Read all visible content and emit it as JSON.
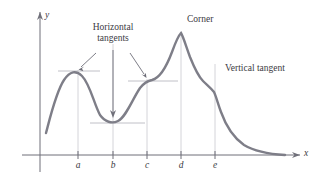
{
  "figure": {
    "background": "#ffffff",
    "curve_color": "#7e7e88",
    "axis_color": "#6e6e78",
    "guide_color": "#c9c9cf",
    "tangent_color": "#b9b9c1",
    "label_color": "#3b3b43",
    "annotations": {
      "horizontal_tangents": "Horizontal\ntangents",
      "horizontal_tangents_line1": "Horizontal",
      "horizontal_tangents_line2": "tangents",
      "corner": "Corner",
      "vertical_tangent": "Vertical tangent"
    },
    "axes": {
      "x_label": "x",
      "y_label": "y",
      "x_axis_y": 155,
      "y_axis_x": 40
    },
    "ticks": [
      {
        "label": "a",
        "x": 78,
        "curve_y": 72
      },
      {
        "label": "b",
        "x": 113,
        "curve_y": 122
      },
      {
        "label": "c",
        "x": 147,
        "curve_y": 81
      },
      {
        "label": "d",
        "x": 181,
        "curve_y": 33
      },
      {
        "label": "e",
        "x": 215,
        "curve_y": 95
      }
    ],
    "tangent_segments": [
      {
        "at": "a",
        "x1": 58,
        "x2": 100,
        "y": 71
      },
      {
        "at": "b",
        "x1": 90,
        "x2": 145,
        "y": 123
      },
      {
        "at": "c",
        "x1": 128,
        "x2": 178,
        "y": 81
      }
    ],
    "curve_path": "M46,133 C50,118 56,92 64,80 C70,71 76,70 82,76 C90,84 94,104 100,115 C105,122 112,124 118,121 C126,117 132,100 140,88 C144,83 147,81 152,80 C160,78 166,68 172,52 C176,41 179,35 181,33 C183,36 186,46 190,57 C194,67 198,76 203,81 C208,86 211,88 214,92 C216,96 218,104 221,112 C226,126 234,138 244,145 C254,151 268,154 285,155",
    "curve_features": {
      "start_point": [
        46,
        133
      ],
      "local_max_a": [
        78,
        72
      ],
      "local_min_b": [
        113,
        122
      ],
      "inflection_flat_c": [
        147,
        81
      ],
      "corner_peak_d": [
        181,
        33
      ],
      "vertical_tangent_e": [
        215,
        95
      ],
      "end_point": [
        285,
        155
      ]
    }
  }
}
